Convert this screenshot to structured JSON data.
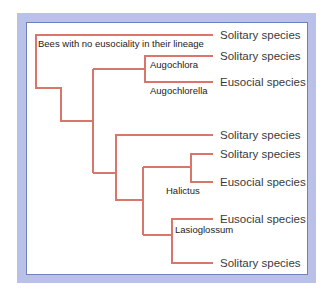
{
  "diagram": {
    "type": "phylogenetic-tree",
    "colors": {
      "branch": "#d8766c",
      "frame_fill": "#b9c1e9",
      "frame_border": "#6f80c2",
      "text": "#3a3a3a"
    },
    "tips": [
      {
        "id": "t1",
        "label": "Solitary species",
        "y": 35
      },
      {
        "id": "t2",
        "label": "Solitary species",
        "y": 56
      },
      {
        "id": "t3",
        "label": "Eusocial species",
        "y": 82
      },
      {
        "id": "t4",
        "label": "Solitary species",
        "y": 135
      },
      {
        "id": "t5",
        "label": "Solitary species",
        "y": 154
      },
      {
        "id": "t6",
        "label": "Eusocial species",
        "y": 182
      },
      {
        "id": "t7",
        "label": "Eusocial species",
        "y": 219
      },
      {
        "id": "t8",
        "label": "Solitary species",
        "y": 263
      }
    ],
    "clade_labels": [
      {
        "label": "Bees with no eusociality in their lineage",
        "x": 38,
        "y": 47
      },
      {
        "label": "Augochlora",
        "x": 150,
        "y": 68
      },
      {
        "label": "Augochlorella",
        "x": 150,
        "y": 94
      },
      {
        "label": "Halictus",
        "x": 166,
        "y": 194
      },
      {
        "label": "Lasioglossum",
        "x": 175,
        "y": 233
      }
    ],
    "branches": [
      "M213,35 H36 V88 H61 V121 H93",
      "M93,69 V173",
      "M93,69 H145",
      "M213,56 H145 V82 H213",
      "M93,173 H116",
      "M213,135 H116 V200 H143",
      "M143,167 V235",
      "M143,167 H191",
      "M213,154 H191 V182 H213",
      "M143,235 H172",
      "M213,219 H172 V263 H213"
    ]
  }
}
